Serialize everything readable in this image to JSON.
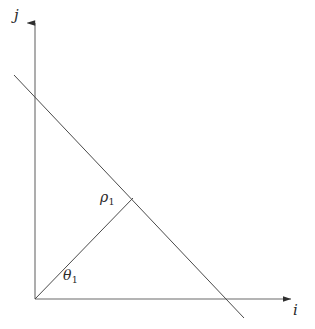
{
  "figure": {
    "type": "line-geometry-diagram",
    "background_color": "#ffffff",
    "stroke_color": "#3a3a3a",
    "text_color": "#2b2b2b"
  },
  "axes": {
    "horizontal": {
      "label": "i",
      "name": "i-axis",
      "origin": {
        "x": 35,
        "y": 299
      },
      "tip": {
        "x": 295,
        "y": 299
      },
      "arrow": true
    },
    "vertical": {
      "label": "j",
      "name": "j-axis",
      "origin": {
        "x": 35,
        "y": 299
      },
      "tip": {
        "x": 35,
        "y": 19
      },
      "arrow": true
    }
  },
  "geometry": {
    "line": {
      "name": "target-line",
      "start": {
        "x": 14,
        "y": 75
      },
      "end": {
        "x": 244,
        "y": 318
      },
      "crosses_j_axis_at": {
        "x": 35,
        "y": 97
      },
      "crosses_i_axis_at": {
        "x": 232,
        "y": 299
      }
    },
    "normal_segment": {
      "name": "rho-segment",
      "label": "ρ",
      "subscript": "1",
      "start": {
        "x": 35,
        "y": 299
      },
      "end": {
        "x": 133,
        "y": 198
      },
      "length_px": 141
    },
    "angle": {
      "name": "theta-angle",
      "label": "θ",
      "subscript": "1",
      "vertex": {
        "x": 35,
        "y": 299
      },
      "between": [
        "i-axis",
        "rho-segment"
      ],
      "approx_degrees": 46
    }
  },
  "labels": {
    "j_axis": "j",
    "i_axis": "i",
    "rho": "ρ",
    "rho_subscript": "1",
    "theta": "θ",
    "theta_subscript": "1"
  }
}
